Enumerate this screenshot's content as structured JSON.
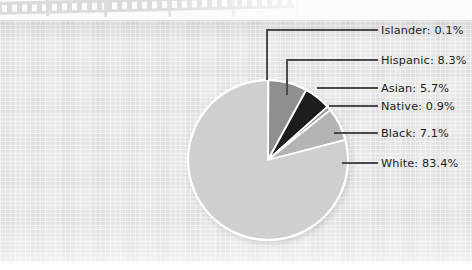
{
  "document": {
    "kind": "scanned-page",
    "paper_color": "#e9e9e9",
    "artifact": "filmstrip-scan-edge"
  },
  "chart_data": {
    "type": "pie",
    "title": "",
    "subtitle": "",
    "xlabel": "",
    "ylabel": "",
    "grid": false,
    "legend_position": "callout-labels-right",
    "label_format": "{name}: {value}%",
    "start_angle_deg": 90,
    "direction": "clockwise",
    "categories": [
      "Islander",
      "Hispanic",
      "Asian",
      "Native",
      "Black",
      "White"
    ],
    "values": [
      0.1,
      8.3,
      5.7,
      0.9,
      7.1,
      83.4
    ],
    "total": 105.5,
    "slices": [
      {
        "name": "Islander",
        "value": 0.1,
        "label": "Islander: 0.1%",
        "color": "#7c7c7c"
      },
      {
        "name": "Hispanic",
        "value": 8.3,
        "label": "Hispanic: 8.3%",
        "color": "#8f8f8f"
      },
      {
        "name": "Asian",
        "value": 5.7,
        "label": "Asian: 5.7%",
        "color": "#1d1d1d"
      },
      {
        "name": "Native",
        "value": 0.9,
        "label": "Native: 0.9%",
        "color": "#9a9a9a"
      },
      {
        "name": "Black",
        "value": 7.1,
        "label": "Black: 7.1%",
        "color": "#b4b4b4"
      },
      {
        "name": "White",
        "value": 83.4,
        "label": "White: 83.4%",
        "color": "#cfcfcf"
      }
    ],
    "separator_color": "#ffffff",
    "outline_color": "#ffffff",
    "leader_line_color": "#4a4a4a",
    "text_color": "#1b1b1b"
  },
  "labels": {
    "islander": "Islander: 0.1%",
    "hispanic": "Hispanic: 8.3%",
    "asian": "Asian: 5.7%",
    "native": "Native: 0.9%",
    "black": "Black: 7.1%",
    "white": "White: 83.4%"
  }
}
